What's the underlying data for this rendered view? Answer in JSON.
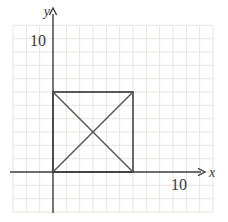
{
  "figure": {
    "canvas": {
      "width": 228,
      "height": 222,
      "background": "#ffffff"
    },
    "grid": {
      "unit_px": 13.333,
      "color": "#e9e2df",
      "stroke_width": 1,
      "x_units": [
        -3,
        12
      ],
      "y_units": [
        -3,
        11
      ]
    },
    "origin_px": {
      "x": 53,
      "y": 172
    },
    "axes": {
      "color": "#3f3f3f",
      "stroke_width": 1.4,
      "x_label": "x",
      "y_label": "y",
      "x_axis_px": {
        "from": 10,
        "to": 201,
        "arrow_tip": 205
      },
      "y_axis_px": {
        "from": 213,
        "to": 14,
        "arrow_tip": 8
      },
      "x_label_pos": {
        "x": 209,
        "y": 176.5
      },
      "y_label_pos": {
        "x": 50,
        "y": 15.5
      }
    },
    "ticks": {
      "x": {
        "label": "10",
        "value": 10,
        "pos": {
          "x": 179,
          "y": 190
        }
      },
      "y": {
        "label": "10",
        "value": 10,
        "pos": {
          "x": 46,
          "y": 45.5
        }
      }
    },
    "shape": {
      "name": "square-with-diagonals",
      "stroke": "#585858",
      "stroke_width": 1.8,
      "diagonal_stroke_width": 1.5,
      "square_vertices_units": [
        [
          0,
          0
        ],
        [
          6,
          0
        ],
        [
          6,
          6
        ],
        [
          0,
          6
        ]
      ],
      "diagonals_units": [
        [
          [
            0,
            6
          ],
          [
            6,
            0
          ]
        ],
        [
          [
            0,
            0
          ],
          [
            6,
            6
          ]
        ]
      ]
    }
  }
}
